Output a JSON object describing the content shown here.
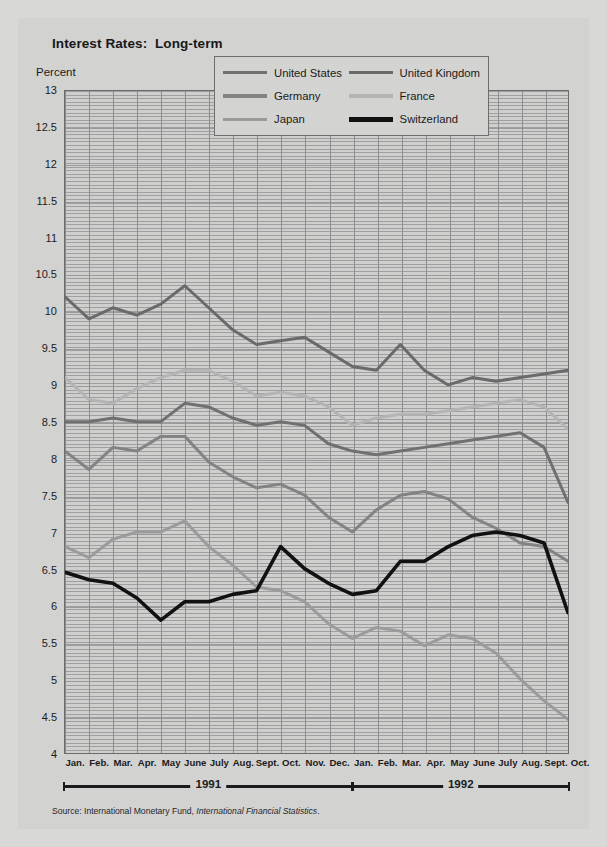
{
  "title": "Interest Rates:  Long-term",
  "ylabel": "Percent",
  "source": {
    "prefix": "Source:  International Monetary Fund, ",
    "italic": "International Financial Statistics",
    "suffix": "."
  },
  "legend": [
    {
      "label": "United States",
      "color": "#707070"
    },
    {
      "label": "United Kingdom",
      "color": "#6a6a6a"
    },
    {
      "label": "Germany",
      "color": "#838383"
    },
    {
      "label": "France",
      "color": "#b4b4b4"
    },
    {
      "label": "Japan",
      "color": "#9b9b9b"
    },
    {
      "label": "Switzerland",
      "color": "#111111"
    }
  ],
  "years": [
    {
      "label": "1991",
      "start": 0,
      "end": 12
    },
    {
      "label": "1992",
      "start": 12,
      "end": 22
    }
  ],
  "chart_data": {
    "type": "line",
    "title": "Interest Rates:  Long-term",
    "xlabel": "",
    "ylabel": "Percent",
    "ylim": [
      4,
      13
    ],
    "ytick_step": 0.5,
    "yticks": [
      13,
      12.5,
      12,
      11.5,
      11,
      10.5,
      10,
      9.5,
      9,
      8.5,
      8,
      7.5,
      7,
      6.5,
      6,
      5.5,
      5,
      4.5,
      4
    ],
    "grid": true,
    "legend_position": "top-right",
    "categories": [
      "Jan.",
      "Feb.",
      "Mar.",
      "Apr.",
      "May",
      "June",
      "July",
      "Aug.",
      "Sept.",
      "Oct.",
      "Nov.",
      "Dec.",
      "Jan.",
      "Feb.",
      "Mar.",
      "Apr.",
      "May",
      "June",
      "July",
      "Aug.",
      "Sept.",
      "Oct."
    ],
    "x_years": [
      "1991",
      "1991",
      "1991",
      "1991",
      "1991",
      "1991",
      "1991",
      "1991",
      "1991",
      "1991",
      "1991",
      "1991",
      "1992",
      "1992",
      "1992",
      "1992",
      "1992",
      "1992",
      "1992",
      "1992",
      "1992",
      "1992"
    ],
    "series": [
      {
        "name": "United Kingdom",
        "color": "#6a6a6a",
        "values": [
          10.2,
          9.9,
          10.05,
          9.95,
          10.1,
          10.35,
          10.05,
          9.75,
          9.55,
          9.6,
          9.65,
          9.45,
          9.25,
          9.2,
          9.55,
          9.2,
          9.0,
          9.1,
          9.05,
          9.1,
          9.15,
          9.2
        ]
      },
      {
        "name": "France",
        "color": "#b4b4b4",
        "values": [
          9.1,
          8.8,
          8.75,
          8.95,
          9.1,
          9.2,
          9.2,
          9.05,
          8.85,
          8.9,
          8.85,
          8.7,
          8.45,
          8.55,
          8.6,
          8.6,
          8.65,
          8.7,
          8.75,
          8.8,
          8.7,
          8.4
        ]
      },
      {
        "name": "United States",
        "color": "#707070",
        "values": [
          8.5,
          8.5,
          8.55,
          8.5,
          8.5,
          8.75,
          8.7,
          8.55,
          8.45,
          8.5,
          8.45,
          8.2,
          8.1,
          8.05,
          8.1,
          8.15,
          8.2,
          8.25,
          8.3,
          8.35,
          8.15,
          7.4
        ]
      },
      {
        "name": "Germany",
        "color": "#838383",
        "values": [
          8.1,
          7.85,
          8.15,
          8.1,
          8.3,
          8.3,
          7.95,
          7.75,
          7.6,
          7.65,
          7.5,
          7.2,
          7.0,
          7.3,
          7.5,
          7.55,
          7.45,
          7.2,
          7.05,
          6.85,
          6.8,
          6.6
        ]
      },
      {
        "name": "Japan",
        "color": "#9b9b9b",
        "values": [
          6.8,
          6.65,
          6.9,
          7.0,
          7.0,
          7.15,
          6.8,
          6.55,
          6.25,
          6.2,
          6.05,
          5.75,
          5.55,
          5.7,
          5.65,
          5.45,
          5.6,
          5.55,
          5.35,
          5.0,
          4.7,
          4.45
        ]
      },
      {
        "name": "Switzerland",
        "color": "#111111",
        "values": [
          6.45,
          6.35,
          6.3,
          6.1,
          5.8,
          6.05,
          6.05,
          6.15,
          6.2,
          6.8,
          6.5,
          6.3,
          6.15,
          6.2,
          6.6,
          6.6,
          6.8,
          6.95,
          7.0,
          6.95,
          6.85,
          5.9
        ]
      }
    ]
  }
}
